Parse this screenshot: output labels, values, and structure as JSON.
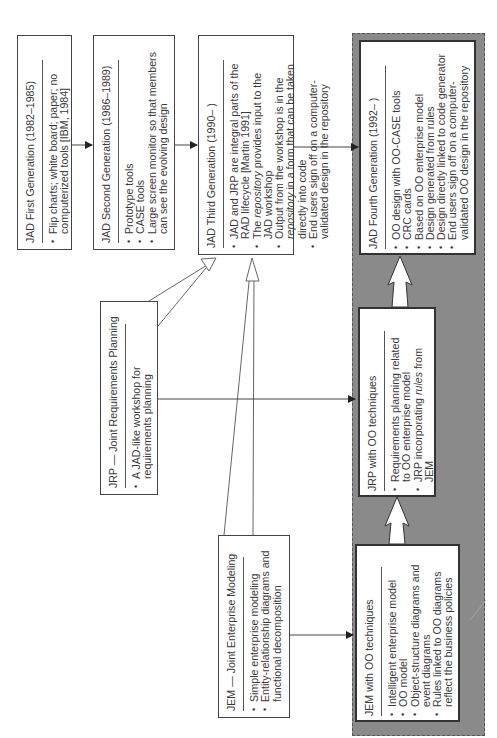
{
  "diagram": {
    "orientation": "rotated-90-ccw",
    "panel_color": "#8a8a8a",
    "boxes": {
      "jad1": {
        "title": "JAD First Generation (1982–1985)",
        "items": [
          [
            "Flip charts; white board; paper; no",
            "computerized tools [IBM, 1984]"
          ]
        ]
      },
      "jad2": {
        "title": "JAD Second Generation (1986–1989)",
        "items": [
          [
            "Prototype tools"
          ],
          [
            "CASE tools"
          ],
          [
            "Large screen monitor so that members",
            "can see the evolving design"
          ]
        ]
      },
      "jad3": {
        "title": "JAD Third Generation (1990–  )",
        "items": [
          [
            "JAD and JRP are integral parts of the",
            "RAD lifecycle [Martin 1991]"
          ],
          [
            "The repository provides input to the",
            "JAD workshop"
          ],
          [
            "Output from the workshop is in the",
            "repository in a form that can be taken",
            "directly into code"
          ],
          [
            "End users sign off on a computer-",
            "validated design in the repository"
          ]
        ]
      },
      "jad4": {
        "title": "JAD Fourth Generation (1992–  )",
        "items": [
          [
            "OO design with OO-CASE tools"
          ],
          [
            "CRC cards"
          ],
          [
            "Based on OO enterprise model"
          ],
          [
            "Design generated from rules"
          ],
          [
            "Design directly linked to code generator"
          ],
          [
            "End users sign off on a computer-",
            "validated OO design in the repository"
          ]
        ]
      },
      "jrp": {
        "title": "JRP — Joint Requirements Planning",
        "items": [
          [
            "A JAD-like workshop for",
            "requirements planning"
          ]
        ]
      },
      "jrp_oo": {
        "title": "JRP with OO techniques",
        "items": [
          [
            "Requirements planning related",
            "to OO enterprise model"
          ],
          [
            "JRP incorporating rules from",
            "JEM"
          ]
        ]
      },
      "jem": {
        "title": "JEM — Joint Enterprise Modeling",
        "items": [
          [
            "Simple enterprise modeling"
          ],
          [
            "Entity-relationship diagrams and",
            "functional decomposition"
          ]
        ]
      },
      "jem_oo": {
        "title": "JEM with OO techniques",
        "items": [
          [
            "Intelligent enterprise model"
          ],
          [
            "OO model"
          ],
          [
            "Object-structure diagrams and",
            "event diagrams"
          ],
          [
            "Rules linked to OO diagrams",
            "reflect the business policies"
          ]
        ]
      }
    },
    "edges": [
      {
        "from": "jad1",
        "to": "jad2",
        "style": "solid-arrow"
      },
      {
        "from": "jad2",
        "to": "jad3",
        "style": "solid-arrow"
      },
      {
        "from": "jad3",
        "to": "jad4",
        "style": "solid-arrow"
      },
      {
        "from": "jrp",
        "to": "jad3",
        "style": "hollow-arrow"
      },
      {
        "from": "jem",
        "to": "jad3",
        "style": "hollow-arrow"
      },
      {
        "from": "jrp",
        "to": "jrp_oo",
        "style": "solid-arrow"
      },
      {
        "from": "jem",
        "to": "jem_oo",
        "style": "solid-arrow"
      },
      {
        "from": "jem_oo",
        "to": "jrp_oo",
        "style": "wide-hollow-arrow"
      },
      {
        "from": "jrp_oo",
        "to": "jad4",
        "style": "wide-hollow-arrow"
      }
    ]
  }
}
